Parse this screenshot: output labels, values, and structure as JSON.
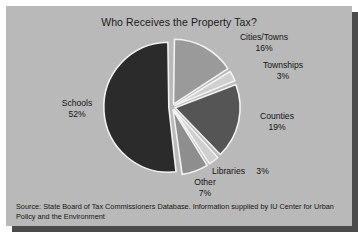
{
  "panel": {
    "title": "Who Receives the Property Tax?",
    "source": "Source: State Board of Tax Commissioners Database. Information supplied by IU Center for Urban Policy and the Environment"
  },
  "labels": {
    "cities": {
      "name": "Cities/Towns",
      "value": "16%"
    },
    "townships": {
      "name": "Townships",
      "value": "3%"
    },
    "counties": {
      "name": "Counties",
      "value": "19%"
    },
    "libraries": {
      "name": "Libraries",
      "value": "3%"
    },
    "other": {
      "name": "Other",
      "value": "7%"
    },
    "schools": {
      "name": "Schools",
      "value": "52%"
    }
  },
  "colors": {
    "panel_bg": "#b9b9b9",
    "shadow": "#4b4b4b",
    "separator": "#f2f2f2",
    "schools": "#2b2b2b",
    "cities": "#9a9a9a",
    "townships": "#cfcfcf",
    "counties": "#555555",
    "libraries": "#cfcfcf",
    "other": "#8e8e8e",
    "text": "#141414"
  },
  "chart_data": {
    "type": "pie",
    "title": "Who Receives the Property Tax?",
    "xlabel": "",
    "ylabel": "",
    "units": "percent",
    "exploded": true,
    "start_angle_deg": 0,
    "direction": "clockwise",
    "legend": "none (direct labels)",
    "grid": false,
    "categories": [
      "Cities/Towns",
      "Townships",
      "Counties",
      "Libraries",
      "Other",
      "Schools"
    ],
    "values": [
      16,
      3,
      19,
      3,
      7,
      52
    ],
    "slices": [
      {
        "label": "Cities/Towns",
        "value": 16,
        "display": "16%",
        "color": "#9a9a9a",
        "start_deg": 0,
        "end_deg": 57.6
      },
      {
        "label": "Townships",
        "value": 3,
        "display": "3%",
        "color": "#cfcfcf",
        "start_deg": 57.6,
        "end_deg": 68.4
      },
      {
        "label": "Counties",
        "value": 19,
        "display": "19%",
        "color": "#555555",
        "start_deg": 68.4,
        "end_deg": 136.8
      },
      {
        "label": "Libraries",
        "value": 3,
        "display": "3%",
        "color": "#cfcfcf",
        "start_deg": 136.8,
        "end_deg": 147.6
      },
      {
        "label": "Other",
        "value": 7,
        "display": "7%",
        "color": "#8e8e8e",
        "start_deg": 147.6,
        "end_deg": 172.8
      },
      {
        "label": "Schools",
        "value": 52,
        "display": "52%",
        "color": "#2b2b2b",
        "start_deg": 172.8,
        "end_deg": 360
      }
    ],
    "total": 100,
    "annotations": [
      "Source: State Board of Tax Commissioners Database. Information supplied by IU Center for Urban Policy and the Environment"
    ]
  }
}
